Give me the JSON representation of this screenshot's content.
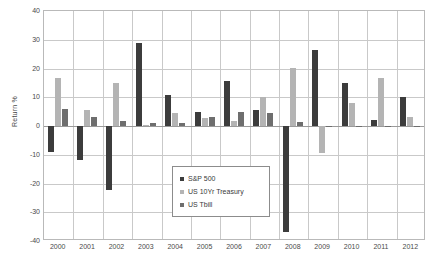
{
  "chart_data": {
    "type": "bar",
    "title": "",
    "xlabel": "",
    "ylabel": "Return %",
    "ylim": [
      -40,
      40
    ],
    "ytick_step": 10,
    "yticks": [
      "40",
      "30",
      "20",
      "10",
      "0",
      "-10",
      "-20",
      "-30",
      "-40"
    ],
    "grid": true,
    "legend_position": "inside-center-bottom",
    "categories": [
      "2000",
      "2001",
      "2002",
      "2003",
      "2004",
      "2005",
      "2006",
      "2007",
      "2008",
      "2009",
      "2010",
      "2011",
      "2012"
    ],
    "series": [
      {
        "name": "S&P 500",
        "color": "#3c3c3c",
        "values": [
          -9.1,
          -11.9,
          -22.1,
          28.7,
          10.9,
          4.9,
          15.8,
          5.5,
          -37.0,
          26.5,
          15.1,
          2.1,
          10.0
        ]
      },
      {
        "name": "US 10Yr Treasury",
        "color": "#b4b4b4",
        "values": [
          16.7,
          5.6,
          15.1,
          0.4,
          4.5,
          2.8,
          1.9,
          10.2,
          20.1,
          -9.5,
          8.0,
          16.8,
          3.0
        ]
      },
      {
        "name": "US Tbill",
        "color": "#6e6e6e",
        "values": [
          5.9,
          3.2,
          1.6,
          1.0,
          1.2,
          3.0,
          4.7,
          4.4,
          1.5,
          0.1,
          0.1,
          0.1,
          0.1
        ]
      }
    ]
  },
  "legend": {
    "items": [
      {
        "label": "S&P 500"
      },
      {
        "label": "US 10Yr Treasury"
      },
      {
        "label": "US Tbill"
      }
    ]
  },
  "axis": {
    "y_title": "Return %"
  }
}
